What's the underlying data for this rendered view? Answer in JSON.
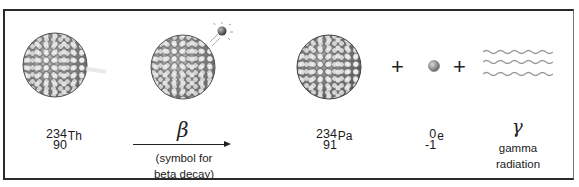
{
  "diagram": {
    "parent": {
      "mass_number": "234",
      "atomic_number": "90",
      "symbol": "Th"
    },
    "process": {
      "symbol": "β",
      "caption_line1": "(symbol for",
      "caption_line2": "beta decay)"
    },
    "daughter": {
      "mass_number": "234",
      "atomic_number": "91",
      "symbol": "Pa"
    },
    "plus_1": "+",
    "electron": {
      "mass_number": "0",
      "atomic_number": "-1",
      "symbol": "e"
    },
    "plus_2": "+",
    "gamma": {
      "symbol": "γ",
      "caption_line1": "gamma",
      "caption_line2": "radiation"
    },
    "colors": {
      "frame": "#2a2a2a",
      "nucleon_dark": "#7d7d7d",
      "nucleon_light": "#e0e0e0",
      "wave": "#9a9a9a"
    }
  }
}
